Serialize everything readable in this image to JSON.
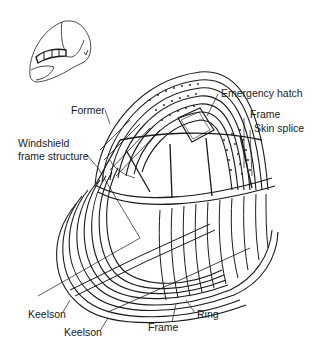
{
  "diagram": {
    "inset": "Nose section overview",
    "labels": {
      "emergency_hatch": "Emergency hatch",
      "former": "Former",
      "frame_top": "Frame",
      "skin_splice": "Skin splice",
      "windshield_line1": "Windshield",
      "windshield_line2": "frame structure",
      "keelson_1": "Keelson",
      "keelson_2": "Keelson",
      "frame_bottom": "Frame",
      "ring": "Ring"
    }
  }
}
